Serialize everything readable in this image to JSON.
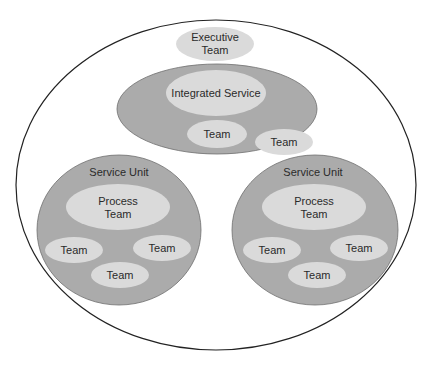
{
  "diagram": {
    "type": "nested-organization",
    "colors": {
      "background": "#ffffff",
      "outer_stroke": "#222222",
      "unit_fill": "#ababab",
      "team_fill": "#dadada",
      "text": "#2a2a2a"
    },
    "executive": {
      "label_line1": "Executive",
      "label_line2": "Team"
    },
    "integrated_service": {
      "label": "Integrated Service",
      "team_inner": "Team",
      "team_overlap": "Team"
    },
    "service_units": [
      {
        "label": "Service Unit",
        "process_team_line1": "Process",
        "process_team_line2": "Team",
        "teams": [
          "Team",
          "Team",
          "Team"
        ]
      },
      {
        "label": "Service Unit",
        "process_team_line1": "Process",
        "process_team_line2": "Team",
        "teams": [
          "Team",
          "Team",
          "Team"
        ]
      }
    ]
  }
}
